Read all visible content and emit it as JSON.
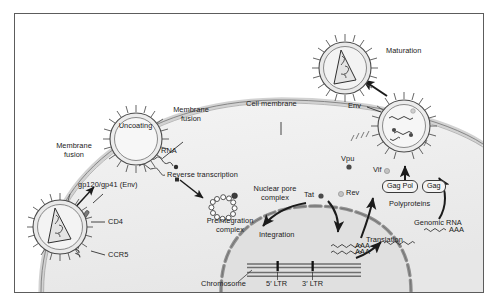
{
  "figure": {
    "type": "biological-pathway-diagram",
    "background": "#ffffff",
    "frame_color": "#5c5c5c"
  },
  "colors": {
    "membrane_light": "#d8d8d8",
    "membrane_dark": "#8a8a8a",
    "cytoplasm": "#f0f0f0",
    "nucleoplasm": "#e4e4e4",
    "nuclear_envelope": "#9a9a9a",
    "virion_fill": "#e8e8e8",
    "virion_outline": "#4a4a4a",
    "text": "#1a1a1a",
    "protein_dark": "#4a4a4a",
    "protein_light": "#c0c0c0"
  },
  "labels": {
    "membrane_fusion_left": "Membrane\nfusion",
    "membrane_fusion_left_line1": "Membrane",
    "membrane_fusion_left_line2": "fusion",
    "membrane_fusion_right_line1": "Membrane",
    "membrane_fusion_right_line2": "fusion",
    "cell_membrane": "Cell membrane",
    "uncoating": "Uncoating",
    "gp120_gp41": "gp120/gp41 (Env)",
    "cd4": "CD4",
    "ccr5": "CCR5",
    "rna": "RNA",
    "reverse_transcription": "Reverse transcription",
    "preintegration_line1": "Preintegration",
    "preintegration_line2": "complex",
    "nuclear_pore_line1": "Nuclear pore",
    "nuclear_pore_line2": "complex",
    "integration": "Integration",
    "chromosome": "Chromosome",
    "ltr5": "5′ LTR",
    "ltr3": "3′ LTR",
    "tat": "Tat",
    "rev": "Rev",
    "vpu": "Vpu",
    "vif": "Vif",
    "env": "Env",
    "translation": "Translation",
    "polyproteins": "Polyproteins",
    "gag_pol": "Gag Pol",
    "gag": "Gag",
    "genomic_rna": "Genomic RNA",
    "maturation": "Maturation",
    "mrna_tail_1": "AAA",
    "mrna_tail_2": "AAA",
    "mrna_tail_3": "AAA"
  },
  "entities": {
    "virions": [
      {
        "name": "free-virion",
        "state": "mature",
        "position": "bottom-left",
        "capsid": "cone"
      },
      {
        "name": "uncoating-virion",
        "state": "uncoating",
        "position": "upper-left",
        "capsid": "none"
      },
      {
        "name": "budding-virion",
        "state": "immature",
        "position": "right",
        "contents": "genomic-RNA-and-proteins"
      },
      {
        "name": "mature-virion",
        "state": "mature",
        "position": "top-right",
        "capsid": "cone"
      }
    ],
    "receptors": [
      "CD4",
      "CCR5"
    ],
    "viral_proteins": [
      {
        "name": "Tat",
        "shade": "dark"
      },
      {
        "name": "Rev",
        "shade": "light"
      },
      {
        "name": "Vpu",
        "shade": "dark"
      },
      {
        "name": "Vif",
        "shade": "light"
      }
    ],
    "polyproteins": [
      "Gag Pol",
      "Gag"
    ],
    "genome_features": [
      "5′ LTR",
      "3′ LTR",
      "Chromosome"
    ]
  },
  "steps": [
    "Membrane fusion",
    "Uncoating",
    "Reverse transcription",
    "Preintegration complex formation",
    "Nuclear pore complex transit",
    "Integration",
    "Transcription",
    "Translation",
    "Assembly and budding",
    "Maturation"
  ]
}
